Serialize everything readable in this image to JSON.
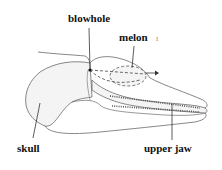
{
  "diagram": {
    "labels": {
      "blowhole": "blowhole",
      "melon": "melon",
      "skull": "skull",
      "upper_jaw": "upper jaw",
      "tick_mark": "ı"
    },
    "colors": {
      "outline": "#6a6a6a",
      "fill": "#f4f4f4",
      "label": "#111111",
      "leader": "#333333"
    }
  }
}
